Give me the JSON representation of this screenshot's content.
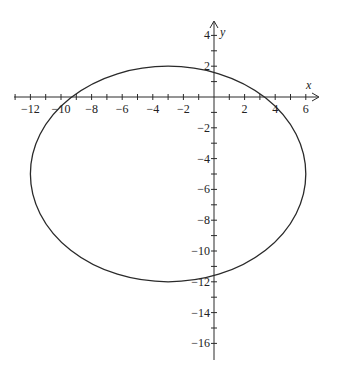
{
  "chart_data": {
    "type": "line",
    "title": "",
    "xlabel": "x",
    "ylabel": "y",
    "xlim": [
      -13,
      6.5
    ],
    "ylim": [
      -16.5,
      4.5
    ],
    "grid": false,
    "legend": null,
    "x_ticks": [
      -12,
      -10,
      -8,
      -6,
      -4,
      -2,
      2,
      4,
      6
    ],
    "y_ticks": [
      4,
      2,
      -2,
      -4,
      -6,
      -8,
      -10,
      -12,
      -14,
      -16
    ],
    "series": [
      {
        "name": "ellipse",
        "shape": "ellipse",
        "center": [
          -3,
          -5
        ],
        "semi_axis_x": 9,
        "semi_axis_y": 7,
        "equation": "(x+3)^2/81 + (y+5)^2/49 = 1"
      }
    ]
  },
  "axes": {
    "x_label": "x",
    "y_label": "y",
    "x_tick_labels": [
      "-12",
      "-10",
      "-8",
      "-6",
      "-4",
      "-2",
      "2",
      "4",
      "6"
    ],
    "y_tick_labels": [
      "4",
      "2",
      "-2",
      "-4",
      "-6",
      "-8",
      "-10",
      "-12",
      "-14",
      "-16"
    ]
  },
  "colors": {
    "stroke": "#2a2a2a",
    "background": "#ffffff"
  }
}
